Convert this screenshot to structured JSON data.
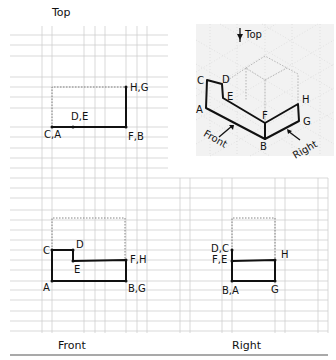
{
  "views": {
    "top": {
      "title": "Top",
      "labels": {
        "hg": "H,G",
        "de": "D,E",
        "ca": "C,A",
        "fb": "F,B"
      }
    },
    "isometric": {
      "top_arrow_label": "Top",
      "front_arrow_label": "Front",
      "right_arrow_label": "Right",
      "vertices": {
        "c": "C",
        "d": "D",
        "e": "E",
        "a": "A",
        "f": "F",
        "b": "B",
        "h": "H",
        "g": "G"
      }
    },
    "front": {
      "title": "Front",
      "labels": {
        "c": "C",
        "d": "D",
        "e": "E",
        "fh": "F,H",
        "a": "A",
        "bg": "B,G"
      }
    },
    "right": {
      "title": "Right",
      "labels": {
        "dc": "D,C",
        "fe": "F,E",
        "h": "H",
        "ba": "B,A",
        "g": "G"
      }
    }
  },
  "colors": {
    "grid": "#cfcfcf",
    "ink": "#111111",
    "iso_bg": "#f2f2f2"
  }
}
